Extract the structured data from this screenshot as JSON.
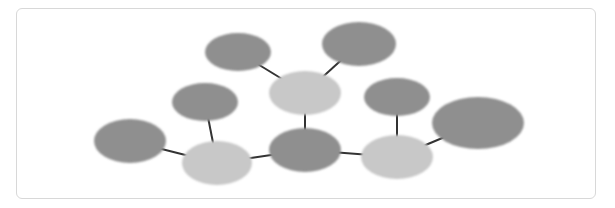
{
  "diagram": {
    "type": "bubble-network",
    "colors": {
      "dark": "#8f8f8f",
      "light": "#c8c8c8",
      "edge": "#333333",
      "border": "#d8d8d8"
    },
    "nodes": [
      {
        "id": "n1",
        "cx": 238,
        "cy": 52,
        "rx": 33,
        "ry": 19,
        "tone": "dark"
      },
      {
        "id": "n2",
        "cx": 359,
        "cy": 44,
        "rx": 37,
        "ry": 22,
        "tone": "dark"
      },
      {
        "id": "n3",
        "cx": 305,
        "cy": 93,
        "rx": 36,
        "ry": 22,
        "tone": "light"
      },
      {
        "id": "n4",
        "cx": 205,
        "cy": 102,
        "rx": 33,
        "ry": 19,
        "tone": "dark"
      },
      {
        "id": "n5",
        "cx": 130,
        "cy": 141,
        "rx": 36,
        "ry": 22,
        "tone": "dark"
      },
      {
        "id": "n6",
        "cx": 217,
        "cy": 163,
        "rx": 35,
        "ry": 22,
        "tone": "light"
      },
      {
        "id": "n7",
        "cx": 305,
        "cy": 150,
        "rx": 36,
        "ry": 22,
        "tone": "dark"
      },
      {
        "id": "n8",
        "cx": 397,
        "cy": 97,
        "rx": 33,
        "ry": 19,
        "tone": "dark"
      },
      {
        "id": "n9",
        "cx": 397,
        "cy": 157,
        "rx": 36,
        "ry": 22,
        "tone": "light"
      },
      {
        "id": "n10",
        "cx": 478,
        "cy": 123,
        "rx": 46,
        "ry": 26,
        "tone": "dark"
      }
    ],
    "edges": [
      [
        "n1",
        "n3"
      ],
      [
        "n2",
        "n3"
      ],
      [
        "n3",
        "n7"
      ],
      [
        "n4",
        "n6"
      ],
      [
        "n5",
        "n6"
      ],
      [
        "n6",
        "n7"
      ],
      [
        "n7",
        "n9"
      ],
      [
        "n8",
        "n9"
      ],
      [
        "n9",
        "n10"
      ]
    ]
  }
}
